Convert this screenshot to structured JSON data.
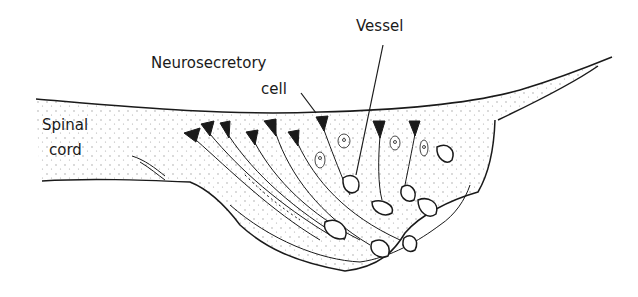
{
  "labels": {
    "vessel": "Vessel",
    "neurosecretory_line1": "Neurosecretory",
    "neurosecretory_line2": "cell",
    "spinal_line1": "Spinal",
    "spinal_line2": "cord"
  },
  "colors": {
    "ink": "#1a1a1a",
    "background": "#ffffff",
    "stipple": "#9a9a9a"
  }
}
